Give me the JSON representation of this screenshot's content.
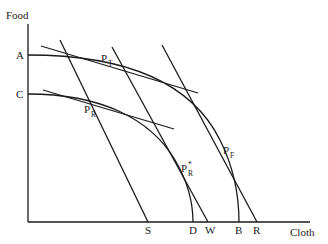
{
  "diagram": {
    "type": "economics-ppf",
    "axes": {
      "y_label": "Food",
      "x_label": "Cloth"
    },
    "y_intercept_labels": [
      "A",
      "C"
    ],
    "x_intercept_labels": [
      "S",
      "D",
      "W",
      "B",
      "R"
    ],
    "points": [
      {
        "main": "P",
        "sub": "T",
        "sup": ""
      },
      {
        "main": "P",
        "sub": "R",
        "sup": ""
      },
      {
        "main": "P",
        "sub": "R",
        "sup": "*"
      },
      {
        "main": "P",
        "sub": "F",
        "sup": ""
      }
    ],
    "curves": [
      {
        "name": "outer-ppf",
        "from": "A",
        "to": "B"
      },
      {
        "name": "inner-ppf",
        "from": "C",
        "to": "D"
      }
    ],
    "lines": [
      {
        "name": "price-line-S",
        "ends_at": "S"
      },
      {
        "name": "price-line-W",
        "ends_at": "W"
      },
      {
        "name": "price-line-R",
        "ends_at": "R"
      },
      {
        "name": "tangent-at-PT"
      },
      {
        "name": "tangent-at-PR"
      }
    ]
  }
}
